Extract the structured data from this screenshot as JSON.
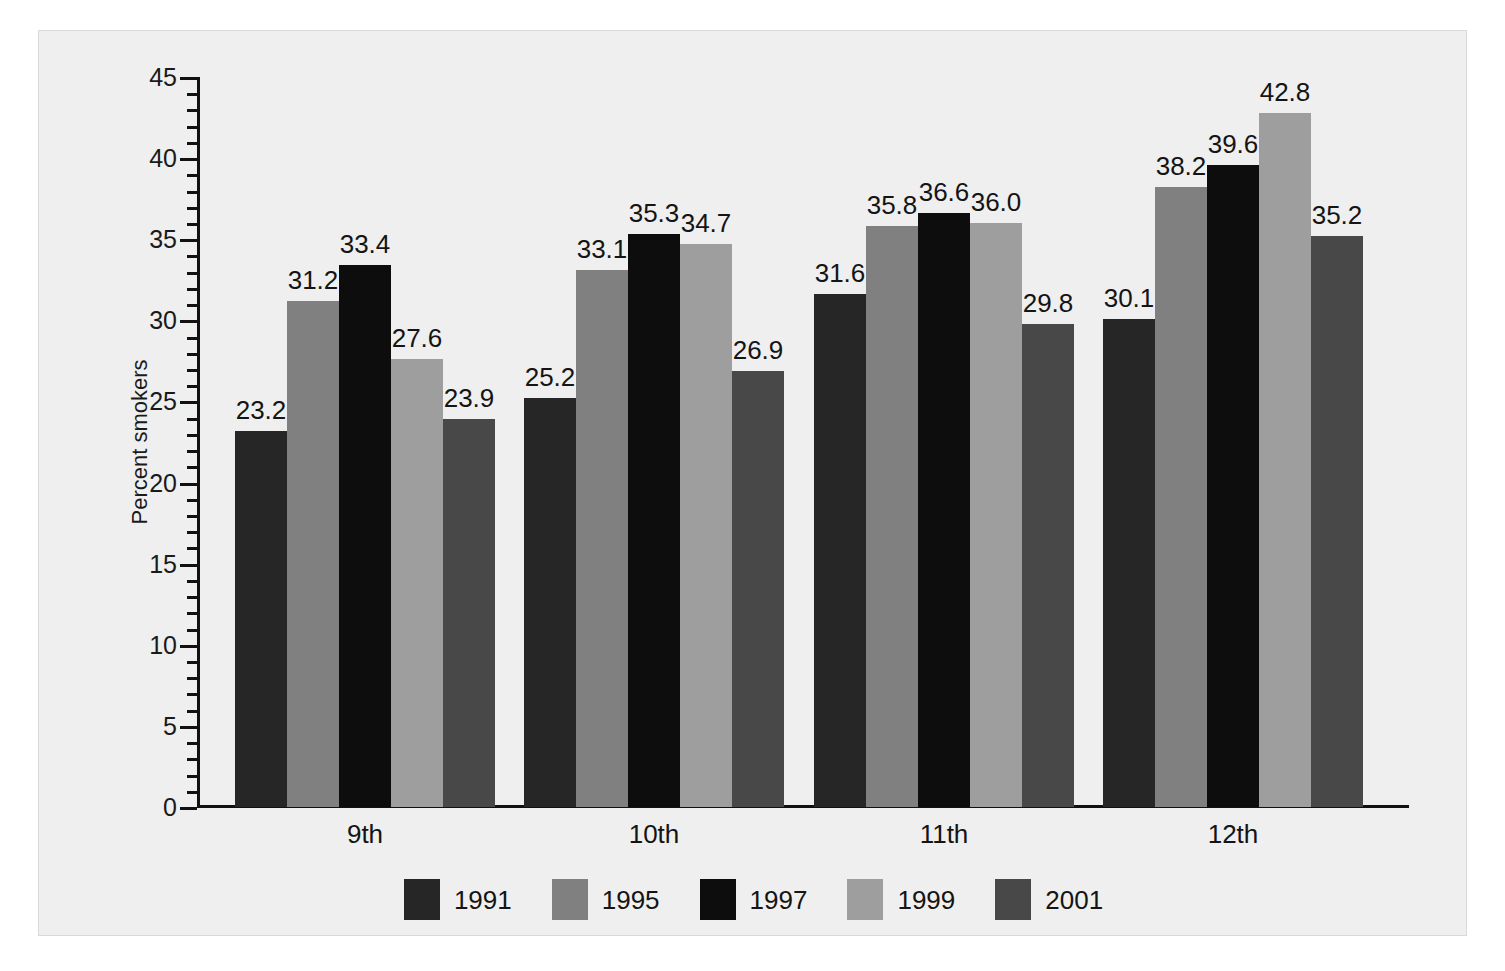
{
  "chart_data": {
    "type": "bar",
    "title": "",
    "subtitle": "",
    "xlabel": "",
    "ylabel": "Percent smokers",
    "ylim": [
      0,
      45
    ],
    "y_major_step": 5,
    "y_minor_step": 1,
    "grid": false,
    "legend_position": "bottom",
    "categories": [
      "9th",
      "10th",
      "11th",
      "12th"
    ],
    "y_tick_labels": [
      "0",
      "5",
      "10",
      "15",
      "20",
      "25",
      "30",
      "35",
      "40",
      "45"
    ],
    "series": [
      {
        "name": "1991",
        "color": "#262626",
        "values": [
          23.2,
          25.2,
          31.6,
          30.1
        ]
      },
      {
        "name": "1995",
        "color": "#808080",
        "values": [
          31.2,
          33.1,
          35.8,
          38.2
        ]
      },
      {
        "name": "1997",
        "color": "#0d0d0d",
        "values": [
          33.4,
          35.3,
          36.6,
          39.6
        ]
      },
      {
        "name": "1999",
        "color": "#9e9e9e",
        "values": [
          27.6,
          34.7,
          36.0,
          42.8
        ]
      },
      {
        "name": "2001",
        "color": "#484848",
        "values": [
          23.9,
          26.9,
          29.8,
          35.2
        ]
      }
    ],
    "data_labels": [
      [
        "23.2",
        "31.2",
        "33.4",
        "27.6",
        "23.9"
      ],
      [
        "25.2",
        "33.1",
        "35.3",
        "34.7",
        "26.9"
      ],
      [
        "31.6",
        "35.8",
        "36.6",
        "36.0",
        "29.8"
      ],
      [
        "30.1",
        "38.2",
        "39.6",
        "42.8",
        "35.2"
      ]
    ]
  },
  "legend": {
    "items": [
      {
        "label": "1991",
        "color": "#262626"
      },
      {
        "label": "1995",
        "color": "#808080"
      },
      {
        "label": "1997",
        "color": "#0d0d0d"
      },
      {
        "label": "1999",
        "color": "#9e9e9e"
      },
      {
        "label": "2001",
        "color": "#484848"
      }
    ]
  },
  "colors": {
    "background": "#ffffff",
    "canvas": "#efefef",
    "axis": "#111111",
    "text": "#141414"
  }
}
